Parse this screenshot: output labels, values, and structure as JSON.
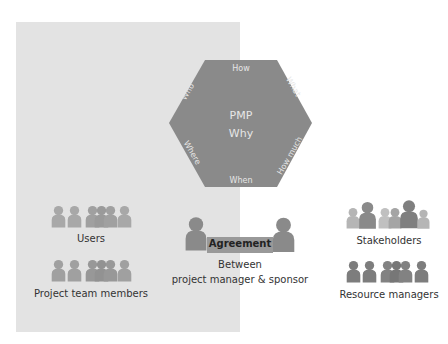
{
  "hexagon": {
    "center_title": "PMP",
    "center_subtitle": "Why",
    "edges": {
      "top": "How",
      "top_right": "What",
      "bottom_right": "How much",
      "bottom": "When",
      "bottom_left": "Where",
      "top_left": "Who"
    },
    "fill": "#8a8a8a",
    "text_color": "#e6e6e6"
  },
  "groups": {
    "users": {
      "label": "Users",
      "color": "#a8a8a8"
    },
    "project_team": {
      "label": "Project team members",
      "color": "#a0a0a0"
    },
    "stakeholders": {
      "label": "Stakeholders",
      "color_light": "#b5b5b5",
      "color_dark": "#7f7f7f"
    },
    "resource_managers": {
      "label": "Resource managers",
      "color": "#7d7d7d"
    }
  },
  "agreement": {
    "bar_label": "Agreement",
    "caption_line1": "Between",
    "caption_line2": "project manager & sponsor",
    "person_color": "#8a8a8a",
    "bar_color": "#999999"
  },
  "panel": {
    "color": "#e3e3e3"
  }
}
